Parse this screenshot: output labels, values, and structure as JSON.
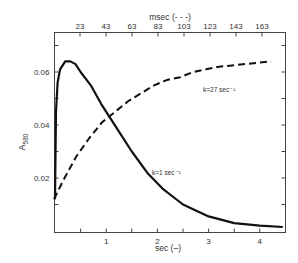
{
  "chart_data": {
    "type": "line",
    "title": "",
    "xlabel": "sec (–)",
    "x2label": "msec (- - -)",
    "ylabel": "A580",
    "ylabel_main": "A",
    "ylabel_sub": "580",
    "xlim": [
      0,
      4.5
    ],
    "x2lim": [
      3,
      180
    ],
    "ylim": [
      0.0,
      0.075
    ],
    "x_ticks": [
      1,
      2,
      3,
      4
    ],
    "x_tick_labels": [
      "1",
      "2",
      "3",
      "4"
    ],
    "x2_ticks": [
      23,
      43,
      63,
      83,
      103,
      123,
      143,
      163
    ],
    "x2_tick_labels": [
      "23",
      "43",
      "63",
      "83",
      "103",
      "123",
      "143",
      "163"
    ],
    "y_ticks": [
      0.02,
      0.04,
      0.06
    ],
    "y_tick_labels": [
      "0.02",
      "0.04",
      "0.06"
    ],
    "grid": false,
    "series": [
      {
        "name": "k=1 sec⁻¹",
        "axis": "sec",
        "style": "solid",
        "x": [
          0.0,
          0.02,
          0.05,
          0.1,
          0.2,
          0.3,
          0.4,
          0.5,
          0.7,
          0.9,
          1.2,
          1.5,
          1.8,
          2.1,
          2.5,
          3.0,
          3.5,
          4.0,
          4.45
        ],
        "values": [
          0.012,
          0.045,
          0.056,
          0.061,
          0.064,
          0.064,
          0.063,
          0.06,
          0.055,
          0.048,
          0.039,
          0.03,
          0.022,
          0.016,
          0.01,
          0.0055,
          0.003,
          0.002,
          0.0015
        ]
      },
      {
        "name": "k=27 sec⁻¹",
        "axis": "msec",
        "style": "dashed",
        "x": [
          3,
          10,
          20,
          30,
          40,
          50,
          60,
          70,
          80,
          90,
          100,
          110,
          120,
          130,
          140,
          150,
          160,
          170
        ],
        "values": [
          0.012,
          0.019,
          0.028,
          0.035,
          0.041,
          0.045,
          0.049,
          0.052,
          0.055,
          0.057,
          0.058,
          0.06,
          0.061,
          0.062,
          0.0625,
          0.063,
          0.0635,
          0.064
        ]
      }
    ],
    "annotations": [
      {
        "text": "k=27 sec⁻¹",
        "near_series": "dashed"
      },
      {
        "text": "k=1 sec⁻¹",
        "near_series": "solid"
      }
    ],
    "legend_position": "none"
  }
}
